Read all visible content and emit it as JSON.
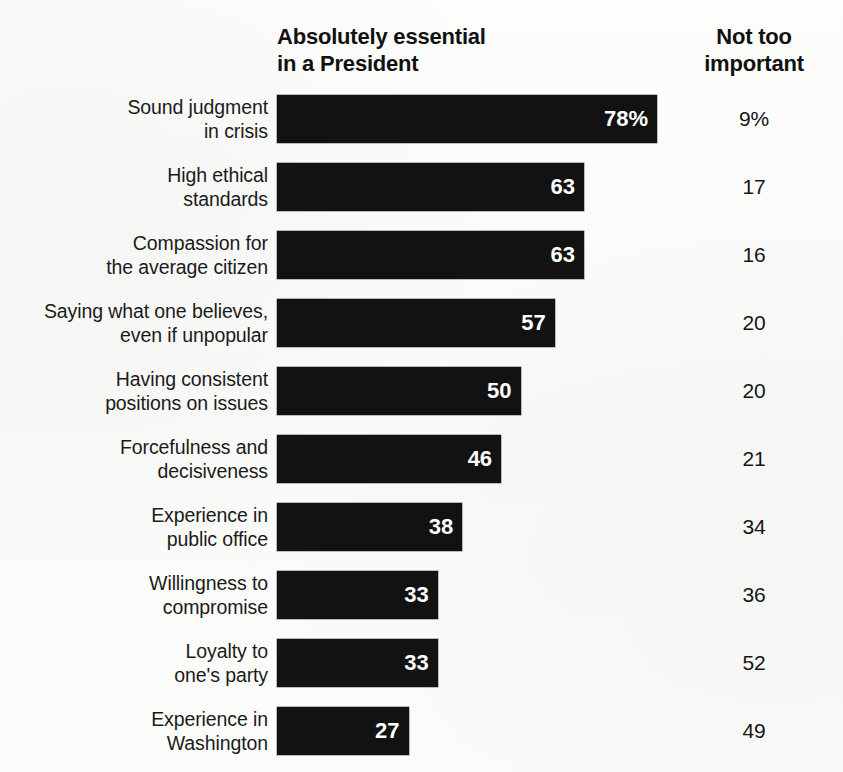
{
  "header": {
    "left_title_line1": "Absolutely essential",
    "left_title_line2": "in a President",
    "right_title_line1": "Not too",
    "right_title_line2": "important"
  },
  "chart_data": {
    "type": "bar",
    "orientation": "horizontal",
    "title": "Absolutely essential in a President",
    "xlabel": "",
    "ylabel": "",
    "xlim": [
      0,
      100
    ],
    "grid": false,
    "legend": false,
    "value_suffix_first_row": "%",
    "bar_color": "#121212",
    "value_label_color": "#ffffff",
    "categories": [
      "Sound judgment in crisis",
      "High ethical standards",
      "Compassion for the average citizen",
      "Saying what one believes, even if unpopular",
      "Having consistent positions on issues",
      "Forcefulness and decisiveness",
      "Experience in public office",
      "Willingness to compromise",
      "Loyalty to one's party",
      "Experience in Washington"
    ],
    "series": [
      {
        "name": "Absolutely essential in a President",
        "values": [
          78,
          63,
          63,
          57,
          50,
          46,
          38,
          33,
          33,
          27
        ]
      },
      {
        "name": "Not too important",
        "values": [
          9,
          17,
          16,
          20,
          20,
          21,
          34,
          36,
          52,
          49
        ]
      }
    ]
  },
  "rows": [
    {
      "label_line1": "Sound judgment",
      "label_line2": "in crisis",
      "bar_value_display": "78%",
      "bar_value": 78,
      "right_value_display": "9%",
      "right_value": 9
    },
    {
      "label_line1": "High ethical",
      "label_line2": "standards",
      "bar_value_display": "63",
      "bar_value": 63,
      "right_value_display": "17",
      "right_value": 17
    },
    {
      "label_line1": "Compassion for",
      "label_line2": "the average citizen",
      "bar_value_display": "63",
      "bar_value": 63,
      "right_value_display": "16",
      "right_value": 16
    },
    {
      "label_line1": "Saying what one believes,",
      "label_line2": "even if unpopular",
      "bar_value_display": "57",
      "bar_value": 57,
      "right_value_display": "20",
      "right_value": 20
    },
    {
      "label_line1": "Having consistent",
      "label_line2": "positions on issues",
      "bar_value_display": "50",
      "bar_value": 50,
      "right_value_display": "20",
      "right_value": 20
    },
    {
      "label_line1": "Forcefulness and",
      "label_line2": "decisiveness",
      "bar_value_display": "46",
      "bar_value": 46,
      "right_value_display": "21",
      "right_value": 21
    },
    {
      "label_line1": "Experience in",
      "label_line2": "public office",
      "bar_value_display": "38",
      "bar_value": 38,
      "right_value_display": "34",
      "right_value": 34
    },
    {
      "label_line1": "Willingness to",
      "label_line2": "compromise",
      "bar_value_display": "33",
      "bar_value": 33,
      "right_value_display": "36",
      "right_value": 36
    },
    {
      "label_line1": "Loyalty to",
      "label_line2": "one's party",
      "bar_value_display": "33",
      "bar_value": 33,
      "right_value_display": "52",
      "right_value": 52
    },
    {
      "label_line1": "Experience in",
      "label_line2": "Washington",
      "bar_value_display": "27",
      "bar_value": 27,
      "right_value_display": "49",
      "right_value": 49
    }
  ],
  "scale": {
    "px_per_unit": 4.872
  }
}
